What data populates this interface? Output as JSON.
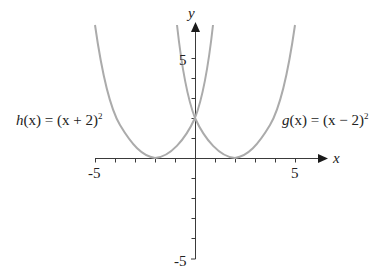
{
  "chart_data": {
    "type": "line",
    "title": "",
    "xlabel": "x",
    "ylabel": "y",
    "xlim": [
      -5,
      6.5
    ],
    "ylim": [
      -5,
      6.5
    ],
    "grid": false,
    "x_ticks": [
      -5,
      -4,
      -3,
      -2,
      -1,
      0,
      1,
      2,
      3,
      4,
      5
    ],
    "y_ticks": [
      -5,
      -4,
      -3,
      -2,
      -1,
      0,
      1,
      2,
      3,
      4,
      5
    ],
    "x_tick_labels": [
      "-5",
      "5"
    ],
    "y_tick_labels": [
      "5",
      "-5"
    ],
    "series": [
      {
        "name": "h(x) = (x + 2)^2",
        "label": "h(x) = (x + 2)²",
        "vertex": [
          -2,
          0
        ],
        "points": [
          [
            -5,
            9
          ],
          [
            -4,
            4
          ],
          [
            -3,
            1
          ],
          [
            -2,
            0
          ],
          [
            -1,
            1
          ],
          [
            0,
            4
          ],
          [
            1,
            9
          ]
        ],
        "color": "#ababab"
      },
      {
        "name": "g(x) = (x - 2)^2",
        "label": "g(x) = (x − 2)²",
        "vertex": [
          2,
          0
        ],
        "points": [
          [
            -1,
            9
          ],
          [
            0,
            4
          ],
          [
            1,
            1
          ],
          [
            2,
            0
          ],
          [
            3,
            1
          ],
          [
            4,
            4
          ],
          [
            5,
            9
          ]
        ],
        "color": "#ababab"
      }
    ],
    "annotations": [
      {
        "text": "h(x) = (x + 2)²",
        "position": "left of h curve, near y≈4"
      },
      {
        "text": "g(x) = (x − 2)²",
        "position": "right of g curve, near y≈4"
      }
    ],
    "intersection": [
      0,
      4
    ]
  },
  "labels": {
    "x_axis": "x",
    "y_axis": "y",
    "x_neg": "-5",
    "x_pos": "5",
    "y_pos": "5",
    "y_neg": "-5",
    "h_name": "h",
    "h_rest": "(x) = (x + 2)",
    "g_name": "g",
    "g_rest": "(x) = (x − 2)",
    "sq": "2"
  },
  "colors": {
    "curve": "#ababab",
    "axis": "#3a3a3a"
  }
}
